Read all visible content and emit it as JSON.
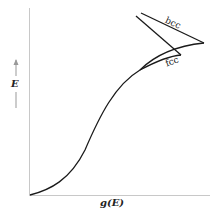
{
  "axes": {
    "y_label": "E",
    "x_label": "g(E)"
  },
  "curves": [
    {
      "name": "bcc",
      "label": "bcc"
    },
    {
      "name": "fcc",
      "label": "fcc"
    }
  ],
  "colors": {
    "line": "#1a1a1a",
    "axis": "#bbbbbb"
  }
}
